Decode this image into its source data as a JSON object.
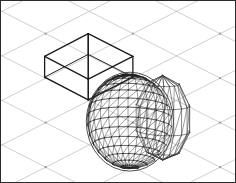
{
  "viewport": {
    "name": "3d-wireframe-viewport",
    "width": 236,
    "height": 183,
    "background_color": "#ffffff",
    "border_color": "#2b2b2b",
    "border_width": 1,
    "projection": "isometric",
    "render_mode": "wireframe"
  },
  "ground_grid": {
    "label": "isometric-ground-grid",
    "color": "#b9b9b9",
    "node_color": "#9a9a9a",
    "line_width": 0.7,
    "cell_half_width": 44,
    "cell_half_height": 22.5,
    "node_origin_x": 45,
    "node_origin_y": 33,
    "node_spacing_x": 88,
    "node_spacing_y": 45,
    "visible": true
  },
  "objects": [
    {
      "id": "box-01",
      "label": "open-top-divided-box",
      "type": "wireframe-box",
      "color": "#1a1a1a",
      "line_width": 1.3,
      "top_apex": [
        88,
        33
      ],
      "left_vertex": [
        44,
        56
      ],
      "right_vertex": [
        133,
        56
      ],
      "front_vertex": [
        88,
        79
      ],
      "depth": 21,
      "divider": true
    },
    {
      "id": "dome-01",
      "label": "dense-triangulated-mesh-dome",
      "type": "triangulated-mesh",
      "color": "#222222",
      "line_width": 0.45,
      "center": [
        130,
        122
      ],
      "radius_x": 44,
      "radius_y": 50,
      "segments": 26,
      "rings": 15
    },
    {
      "id": "hemisphere-02",
      "label": "coarse-polygonal-hemisphere",
      "type": "wireframe-hemisphere",
      "color": "#3a3a3a",
      "line_width": 0.6,
      "center": [
        163,
        118
      ],
      "radius_x": 28,
      "radius_y": 45,
      "segments": 9,
      "rings": 5
    }
  ],
  "chart_data": {
    "type": "table",
    "columns": [
      "object",
      "primitive",
      "shading"
    ],
    "rows": [
      [
        "box-01",
        "box",
        "wireframe"
      ],
      [
        "dome-01",
        "sphere",
        "dense triangle mesh"
      ],
      [
        "hemisphere-02",
        "sphere",
        "coarse wireframe"
      ]
    ]
  }
}
